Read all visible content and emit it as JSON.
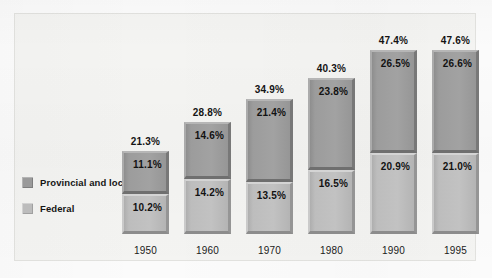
{
  "chart_data": {
    "type": "bar",
    "subtype": "stacked-column-3d",
    "title": "",
    "subtitle": "",
    "xlabel": "",
    "ylabel": "",
    "grid": false,
    "legend_position": "left-middle",
    "ylim": [
      0,
      50
    ],
    "value_suffix": "%",
    "categories": [
      "1950",
      "1960",
      "1970",
      "1980",
      "1990",
      "1995"
    ],
    "series": [
      {
        "name": "Federal",
        "color": "#bcbcbc",
        "values": [
          10.2,
          14.2,
          13.5,
          16.5,
          20.9,
          21.0
        ],
        "labels": [
          "10.2%",
          "14.2%",
          "13.5%",
          "16.5%",
          "20.9%",
          "21.0%"
        ]
      },
      {
        "name": "Provincial and local",
        "color": "#9a9a9a",
        "values": [
          11.1,
          14.6,
          21.4,
          23.8,
          26.5,
          26.6
        ],
        "labels": [
          "11.1%",
          "14.6%",
          "21.4%",
          "23.8%",
          "26.5%",
          "26.6%"
        ]
      }
    ],
    "totals": [
      21.3,
      28.8,
      34.9,
      40.3,
      47.4,
      47.6
    ],
    "total_labels": [
      "21.3%",
      "28.8%",
      "34.9%",
      "40.3%",
      "47.4%",
      "47.6%"
    ]
  },
  "legend": {
    "items": [
      {
        "label": "Provincial and local",
        "color": "#9a9a9a"
      },
      {
        "label": "Federal",
        "color": "#bcbcbc"
      }
    ]
  },
  "axis": {
    "categories": [
      "1950",
      "1960",
      "1970",
      "1980",
      "1990",
      "1995"
    ]
  }
}
